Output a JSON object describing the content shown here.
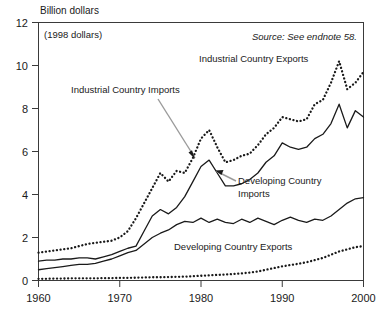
{
  "chart_data": {
    "type": "line",
    "title": "Billion dollars",
    "subtitle": "(1998 dollars)",
    "source_note": "Source: See endnote 58.",
    "xlabel": "",
    "ylabel": "Billion dollars",
    "xlim": [
      1960,
      2000
    ],
    "ylim": [
      0,
      12
    ],
    "grid": false,
    "legend_position": "inline-annotations",
    "xticks": [
      "1960",
      "1970",
      "1980",
      "1990",
      "2000"
    ],
    "yticks": [
      "0",
      "2",
      "4",
      "6",
      "8",
      "10",
      "12"
    ],
    "x": [
      1960,
      1961,
      1962,
      1963,
      1964,
      1965,
      1966,
      1967,
      1968,
      1969,
      1970,
      1971,
      1972,
      1973,
      1974,
      1975,
      1976,
      1977,
      1978,
      1979,
      1980,
      1981,
      1982,
      1983,
      1984,
      1985,
      1986,
      1987,
      1988,
      1989,
      1990,
      1991,
      1992,
      1993,
      1994,
      1995,
      1996,
      1997,
      1998,
      1999,
      2000
    ],
    "series": [
      {
        "name": "Industrial Country Exports",
        "style": "dotted",
        "label_text": "Industrial Country Exports",
        "values": [
          1.3,
          1.35,
          1.4,
          1.45,
          1.5,
          1.6,
          1.7,
          1.75,
          1.8,
          1.85,
          2.0,
          2.3,
          2.9,
          3.6,
          4.3,
          5.0,
          4.6,
          5.1,
          5.0,
          5.7,
          6.6,
          7.0,
          6.2,
          5.5,
          5.6,
          5.8,
          5.9,
          6.3,
          6.8,
          7.1,
          7.6,
          7.5,
          7.4,
          7.5,
          8.2,
          8.4,
          9.2,
          10.2,
          8.9,
          9.2,
          9.7
        ]
      },
      {
        "name": "Industrial Country Imports",
        "style": "solid",
        "label_text": "Industrial Country Imports",
        "values": [
          0.9,
          0.95,
          0.95,
          1.0,
          1.0,
          1.05,
          1.05,
          1.0,
          1.1,
          1.2,
          1.35,
          1.5,
          1.6,
          2.3,
          3.0,
          3.3,
          3.1,
          3.4,
          3.9,
          4.6,
          5.3,
          5.6,
          5.0,
          4.4,
          4.4,
          4.5,
          4.7,
          5.0,
          5.5,
          5.8,
          6.4,
          6.2,
          6.1,
          6.2,
          6.6,
          6.8,
          7.3,
          8.2,
          7.1,
          7.9,
          7.6
        ]
      },
      {
        "name": "Developing Country Imports",
        "style": "solid",
        "label_text": "Developing Country Imports",
        "values": [
          0.5,
          0.55,
          0.6,
          0.65,
          0.7,
          0.75,
          0.75,
          0.8,
          0.9,
          1.0,
          1.15,
          1.3,
          1.4,
          1.7,
          2.0,
          2.2,
          2.35,
          2.6,
          2.75,
          2.7,
          2.9,
          2.7,
          2.85,
          2.7,
          2.65,
          2.85,
          2.7,
          2.9,
          2.75,
          2.6,
          2.8,
          2.95,
          2.8,
          2.7,
          2.85,
          2.8,
          3.0,
          3.3,
          3.6,
          3.8,
          3.85
        ]
      },
      {
        "name": "Developing Country Exports",
        "style": "dotted",
        "label_text": "Developing Country Exports",
        "values": [
          0.08,
          0.08,
          0.09,
          0.09,
          0.1,
          0.1,
          0.1,
          0.1,
          0.11,
          0.11,
          0.12,
          0.12,
          0.13,
          0.14,
          0.15,
          0.15,
          0.16,
          0.17,
          0.18,
          0.2,
          0.22,
          0.24,
          0.26,
          0.28,
          0.3,
          0.33,
          0.37,
          0.42,
          0.5,
          0.58,
          0.66,
          0.72,
          0.78,
          0.85,
          0.95,
          1.05,
          1.2,
          1.35,
          1.45,
          1.55,
          1.6
        ]
      }
    ],
    "annotations": [
      {
        "name": "industrial-country-imports-leader",
        "text": "Industrial Country Imports",
        "has_arrow": true
      },
      {
        "name": "developing-country-imports-leader",
        "text": "Developing Country Imports",
        "has_arrow": true
      }
    ]
  }
}
